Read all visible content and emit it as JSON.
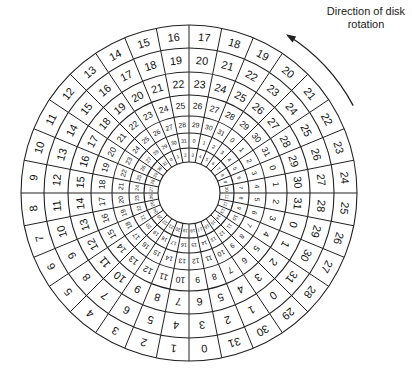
{
  "caption": {
    "line1": "Direction of disk",
    "line2": "rotation"
  },
  "diagram": {
    "type": "disk-cylinder-skew",
    "center": [
      189,
      193
    ],
    "radii": [
      31,
      45,
      60,
      77,
      98,
      121,
      145,
      168
    ],
    "sectors_per_track": 32,
    "track_skew_sectors": 3,
    "tracks": [
      {
        "name": "track-outer",
        "top_boundary": [
          16,
          17
        ]
      },
      {
        "name": "track-2",
        "top_boundary": [
          19,
          20
        ]
      },
      {
        "name": "track-3",
        "top_boundary": [
          22,
          23
        ]
      },
      {
        "name": "track-4",
        "top_boundary": [
          25,
          26
        ]
      },
      {
        "name": "track-5",
        "top_boundary": [
          28,
          29
        ]
      },
      {
        "name": "track-6",
        "top_boundary": [
          31,
          0
        ]
      },
      {
        "name": "track-inner",
        "top_boundary": [
          2,
          3
        ]
      }
    ],
    "line_color": "#222222",
    "text_color": "#111111",
    "arrow": {
      "direction": "counterclockwise",
      "label_ref": "caption"
    }
  }
}
